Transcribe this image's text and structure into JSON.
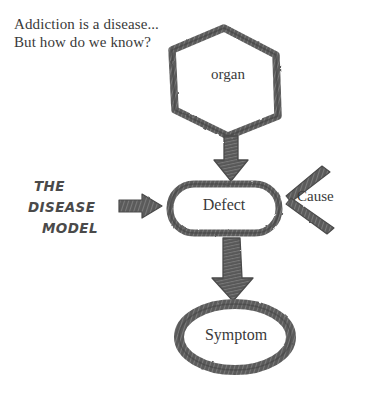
{
  "canvas": {
    "width": 365,
    "height": 398,
    "background": "#ffffff",
    "ink_color": "#555555",
    "text_color": "#3a3a3a"
  },
  "title": {
    "line1": "Addiction is a disease...",
    "line2": "But how do we know?"
  },
  "caption": {
    "line1": "THE",
    "line2": "DISEASE",
    "line3": "MODEL"
  },
  "nodes": {
    "organ": {
      "label": "organ",
      "shape": "hexagon",
      "cx": 224,
      "cy": 82,
      "rx": 55,
      "ry": 54
    },
    "defect": {
      "label": "Defect",
      "shape": "rounded-rectangle",
      "x": 169,
      "y": 183,
      "width": 110,
      "height": 50
    },
    "symptom": {
      "label": "Symptom",
      "shape": "ellipse",
      "cx": 235,
      "cy": 337,
      "rx": 58,
      "ry": 35
    }
  },
  "annotations": {
    "cause": {
      "label": "Cause",
      "shape": "two-angled-strokes",
      "points_to": "defect"
    }
  },
  "arrows": [
    {
      "name": "organ-to-defect",
      "from": "organ",
      "to": "defect",
      "direction": "down",
      "x": 231,
      "y1": 136,
      "y2": 180
    },
    {
      "name": "defect-to-symptom",
      "from": "defect",
      "to": "symptom",
      "direction": "down",
      "x": 231,
      "y1": 237,
      "y2": 299
    },
    {
      "name": "caption-to-defect",
      "from": "caption",
      "to": "defect",
      "direction": "right",
      "y": 206,
      "x1": 120,
      "x2": 161
    }
  ]
}
